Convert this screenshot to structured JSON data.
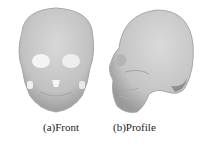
{
  "figure": {
    "panels": [
      {
        "id": "a",
        "caption": "(a)Front",
        "content": "3D rendered skull, front view"
      },
      {
        "id": "b",
        "caption": "(b)Profile",
        "content": "3D rendered skull, side (profile) view"
      }
    ],
    "colors": {
      "bone": "#c9c9c9",
      "bone_shadow": "#9a9a9a",
      "highlight": "#f2f2f2",
      "background": "#ffffff"
    }
  }
}
